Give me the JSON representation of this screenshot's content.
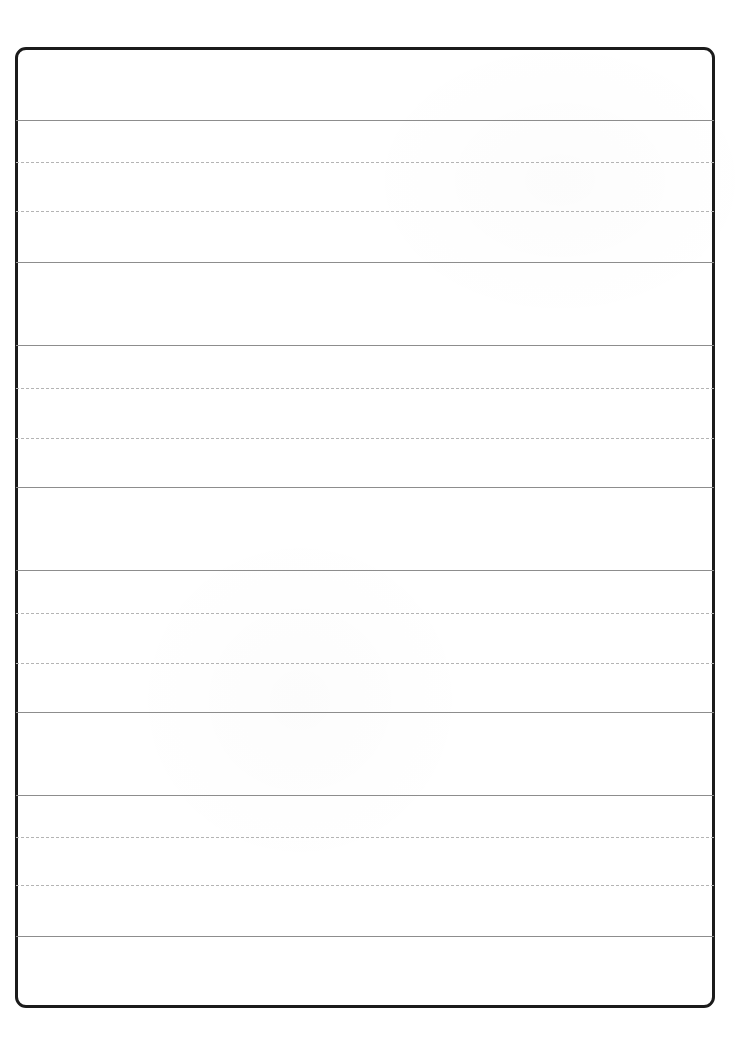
{
  "document": {
    "kind": "handwriting-practice-worksheet",
    "title": "",
    "content_text": "",
    "page_width": 745,
    "page_height": 1042,
    "background_color": "#ffffff"
  },
  "frame": {
    "name": "worksheet-border",
    "x": 15,
    "y": 47,
    "width": 700,
    "height": 961,
    "border_width": 3,
    "border_radius": 11,
    "border_color": "#1b1b1b"
  },
  "rules": {
    "solid_color": "#8d8d8d",
    "dotted_color": "#b4b4b4",
    "left": 16,
    "right": 714,
    "solid_lines": [
      120,
      262,
      345,
      487,
      570,
      712,
      795,
      936
    ],
    "dotted_lines": [
      162,
      211,
      388,
      438,
      613,
      663,
      837,
      885
    ]
  },
  "line_groups": [
    {
      "label": "group-1",
      "type": "gap-band",
      "top": 47,
      "bottom": 120
    },
    {
      "label": "group-2",
      "type": "writing-band",
      "top": 120,
      "bottom": 262,
      "midlines": [
        162,
        211
      ]
    },
    {
      "label": "group-3",
      "type": "gap-band",
      "top": 262,
      "bottom": 345
    },
    {
      "label": "group-4",
      "type": "writing-band",
      "top": 345,
      "bottom": 487,
      "midlines": [
        388,
        438
      ]
    },
    {
      "label": "group-5",
      "type": "gap-band",
      "top": 487,
      "bottom": 570
    },
    {
      "label": "group-6",
      "type": "writing-band",
      "top": 570,
      "bottom": 712,
      "midlines": [
        613,
        663
      ]
    },
    {
      "label": "group-7",
      "type": "gap-band",
      "top": 712,
      "bottom": 795
    },
    {
      "label": "group-8",
      "type": "writing-band",
      "top": 795,
      "bottom": 936,
      "midlines": [
        837,
        885
      ]
    },
    {
      "label": "group-9",
      "type": "gap-band",
      "top": 936,
      "bottom": 1008
    }
  ]
}
